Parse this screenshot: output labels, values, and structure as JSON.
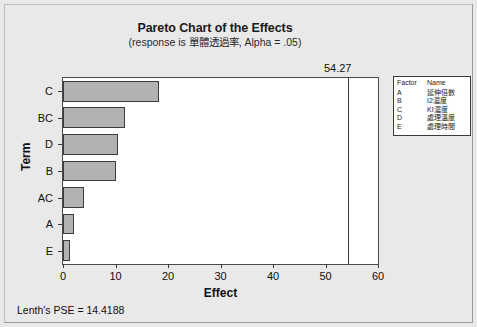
{
  "chart_data": {
    "type": "bar",
    "orientation": "horizontal",
    "title": "Pareto Chart of the Effects",
    "subtitle": "(response is 單體透過率, Alpha = .05)",
    "xlabel": "Effect",
    "ylabel": "Term",
    "categories": [
      "C",
      "BC",
      "D",
      "B",
      "AC",
      "A",
      "E"
    ],
    "values": [
      18.2,
      11.9,
      10.4,
      10.0,
      4.0,
      2.0,
      1.4
    ],
    "xlim": [
      0,
      60
    ],
    "xticks": [
      "0",
      "10",
      "20",
      "30",
      "40",
      "50",
      "60"
    ],
    "xtick_values": [
      0,
      10,
      20,
      30,
      40,
      50,
      60
    ],
    "grid": false,
    "reference_line": {
      "value": 54.27,
      "label": "54.27"
    },
    "annotation": "Lenth's PSE = 14.4188",
    "legend_position": "right"
  },
  "factor_legend": {
    "header_factor": "Factor",
    "header_name": "Name",
    "rows": [
      {
        "factor": "A",
        "name": "延伸倍數"
      },
      {
        "factor": "B",
        "name": "I2濃度"
      },
      {
        "factor": "C",
        "name": "KI濃度"
      },
      {
        "factor": "D",
        "name": "處理溫度"
      },
      {
        "factor": "E",
        "name": "處理時間"
      }
    ]
  },
  "colors": {
    "bar_fill": "#b2b2b2",
    "bar_stroke": "#3d3d3d",
    "plot_background": "#ffffff",
    "window_background": "#e9e9e9",
    "axis": "#3a3a3a",
    "text": "#101010"
  }
}
